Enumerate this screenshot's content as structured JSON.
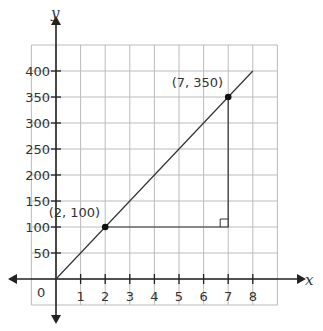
{
  "chart_data": {
    "type": "line",
    "title": "",
    "xlabel": "x",
    "ylabel": "y",
    "xlim": [
      -1,
      9
    ],
    "ylim": [
      -50,
      450
    ],
    "grid": true,
    "x_ticks": [
      "1",
      "2",
      "3",
      "4",
      "5",
      "6",
      "7",
      "8"
    ],
    "y_ticks": [
      "50",
      "100",
      "150",
      "200",
      "250",
      "300",
      "350",
      "400"
    ],
    "origin_label": "0",
    "series": [
      {
        "name": "y = 50x",
        "x": [
          0,
          8
        ],
        "y": [
          0,
          400
        ]
      }
    ],
    "points": [
      {
        "x": 2,
        "y": 100,
        "label": "(2, 100)"
      },
      {
        "x": 7,
        "y": 350,
        "label": "(7, 350)"
      }
    ],
    "annotations": [
      {
        "type": "slope-triangle",
        "from": [
          2,
          100
        ],
        "corner": [
          7,
          100
        ],
        "to": [
          7,
          350
        ],
        "right_angle_marker": true
      }
    ],
    "colors": {
      "line": "#333333",
      "grid": "#bbbbbb",
      "axis": "#222222"
    }
  }
}
